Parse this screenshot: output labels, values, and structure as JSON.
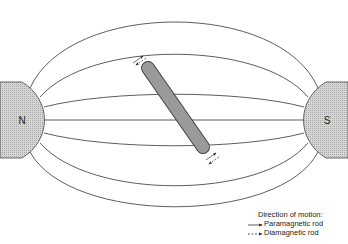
{
  "diagram": {
    "poles": [
      {
        "label": "N",
        "side": "left"
      },
      {
        "label": "S",
        "side": "right"
      }
    ],
    "legend": {
      "title": "Direction of motion:",
      "items": [
        {
          "line": "solid",
          "label": "Paramagnetic rod"
        },
        {
          "line": "dashed",
          "label": "Diamagnetic rod"
        }
      ]
    },
    "colors": {
      "line": "#333333",
      "pole_fill": "#c8c8c8",
      "rod_fill": "#9a9a9a"
    }
  }
}
